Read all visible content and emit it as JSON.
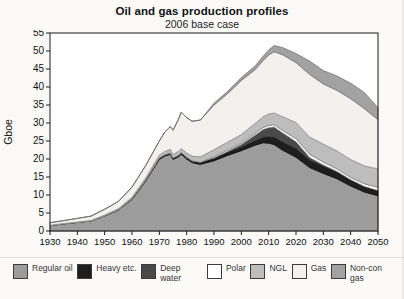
{
  "chart_data": {
    "type": "area",
    "stacked": true,
    "title": "Oil and gas production profiles",
    "subtitle": "2006 base case",
    "ylabel": "Gboe",
    "ylim": [
      0,
      55
    ],
    "xlim": [
      1930,
      2050
    ],
    "grid": false,
    "legend_position": "bottom",
    "yticks": [
      0,
      5,
      10,
      15,
      20,
      25,
      30,
      35,
      40,
      45,
      50,
      55
    ],
    "xticks": [
      1930,
      1940,
      1950,
      1960,
      1970,
      1980,
      1990,
      2000,
      2010,
      2020,
      2030,
      2040,
      2050
    ],
    "x": [
      1930,
      1935,
      1940,
      1945,
      1950,
      1955,
      1960,
      1965,
      1970,
      1972,
      1974,
      1975,
      1977,
      1978,
      1980,
      1982,
      1985,
      1990,
      1995,
      2000,
      2005,
      2008,
      2010,
      2012,
      2015,
      2020,
      2025,
      2030,
      2035,
      2040,
      2045,
      2050
    ],
    "series": [
      {
        "name": "regular-oil",
        "legend": "Regular oil",
        "color": "#9c9c9c",
        "outline": "#585858",
        "values": [
          1.5,
          2.0,
          2.4,
          2.8,
          4.2,
          5.8,
          8.8,
          13.9,
          19.9,
          20.8,
          21.3,
          19.9,
          20.6,
          21.3,
          20.0,
          19.0,
          18.5,
          19.5,
          21.0,
          22.3,
          23.8,
          24.5,
          24.4,
          24.0,
          22.5,
          20.5,
          17.6,
          16.0,
          14.5,
          12.5,
          10.8,
          9.8
        ]
      },
      {
        "name": "heavy-etc",
        "legend": "Heavy etc.",
        "color": "#1e1e1e",
        "outline": "#000000",
        "values": [
          0,
          0,
          0,
          0,
          0.05,
          0.1,
          0.2,
          0.3,
          0.4,
          0.4,
          0.4,
          0.4,
          0.45,
          0.5,
          0.5,
          0.5,
          0.6,
          0.7,
          0.8,
          0.9,
          1.2,
          1.5,
          1.7,
          2.0,
          2.2,
          2.3,
          2.0,
          1.9,
          1.8,
          1.6,
          1.5,
          1.4
        ]
      },
      {
        "name": "deep-water",
        "legend": "Deep water",
        "color": "#4a4a4a",
        "outline": "#222222",
        "values": [
          0,
          0,
          0,
          0,
          0,
          0,
          0,
          0,
          0,
          0,
          0,
          0,
          0,
          0,
          0,
          0,
          0,
          0.1,
          0.3,
          0.8,
          1.6,
          2.2,
          2.6,
          2.9,
          2.6,
          2.0,
          0.8,
          0.45,
          0.25,
          0.15,
          0.1,
          0.05
        ]
      },
      {
        "name": "polar",
        "legend": "Polar",
        "color": "#ffffff",
        "outline": "#888888",
        "values": [
          0,
          0,
          0,
          0,
          0,
          0,
          0,
          0,
          0,
          0,
          0,
          0,
          0,
          0,
          0,
          0,
          0,
          0.3,
          0.4,
          0.4,
          0.5,
          0.55,
          0.6,
          0.6,
          0.7,
          0.8,
          0.9,
          0.8,
          0.7,
          0.6,
          0.7,
          0.9
        ]
      },
      {
        "name": "ngl",
        "legend": "NGL",
        "color": "#bdbdbd",
        "outline": "#7d7d7d",
        "values": [
          0.1,
          0.1,
          0.1,
          0.15,
          0.2,
          0.3,
          0.4,
          0.6,
          0.8,
          0.9,
          1.0,
          1.0,
          1.1,
          1.1,
          1.2,
          1.3,
          1.5,
          2.0,
          2.2,
          2.4,
          2.8,
          3.0,
          3.2,
          3.3,
          3.8,
          4.5,
          4.8,
          5.0,
          5.0,
          5.0,
          5.0,
          5.1
        ]
      },
      {
        "name": "gas",
        "legend": "Gas",
        "color": "#f2f1ee",
        "outline": "#8f8f8f",
        "values": [
          0.7,
          0.8,
          1.0,
          1.2,
          1.6,
          2.0,
          2.8,
          3.4,
          3.9,
          5.4,
          6.3,
          6.7,
          8.9,
          10.1,
          9.8,
          9.7,
          10.2,
          12.4,
          13.5,
          15.0,
          14.9,
          15.6,
          16.4,
          17.0,
          17.2,
          16.7,
          17.4,
          16.7,
          16.8,
          16.9,
          15.9,
          13.7
        ]
      },
      {
        "name": "non-con-gas",
        "legend": "Non-con gas",
        "color": "#a2a2a2",
        "outline": "#6b6b6b",
        "values": [
          0,
          0,
          0,
          0,
          0,
          0,
          0,
          0,
          0,
          0,
          0,
          0,
          0,
          0,
          0,
          0,
          0,
          0.5,
          0.6,
          0.8,
          1.0,
          1.2,
          1.4,
          1.7,
          2.0,
          2.5,
          3.7,
          3.7,
          4.0,
          4.3,
          4.5,
          3.3
        ]
      }
    ]
  }
}
